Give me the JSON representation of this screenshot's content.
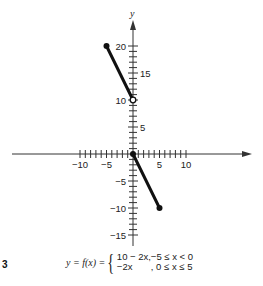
{
  "figure": {
    "number_label": "3",
    "y_axis_label": "y",
    "formula": {
      "lhs": "y = f(x) =",
      "cases": [
        {
          "expr": "10 − 2x,",
          "cond": "−5 ≤ x < 0"
        },
        {
          "expr": "−2x",
          "cond": ",   0 ≤ x ≤ 5"
        }
      ]
    }
  },
  "chart_data": {
    "type": "line",
    "title": "",
    "xlabel": "",
    "ylabel": "y",
    "function": "y = f(x) = { 10 − 2x, −5 ≤ x < 0 ; −2x, 0 ≤ x ≤ 5 }",
    "xlim": [
      -23,
      24
    ],
    "ylim": [
      -18,
      22
    ],
    "x_ticks": [
      -10,
      -9,
      -8,
      -7,
      -6,
      -5,
      -4,
      -3,
      -2,
      -1,
      0,
      1,
      2,
      3,
      4,
      5,
      6,
      7,
      8,
      9,
      10
    ],
    "x_tick_labels": [
      {
        "value": -10,
        "label": "−10"
      },
      {
        "value": -5,
        "label": "−5"
      },
      {
        "value": 5,
        "label": "5"
      },
      {
        "value": 10,
        "label": "10"
      }
    ],
    "y_ticks": [
      -15,
      -14,
      -13,
      -12,
      -11,
      -10,
      -9,
      -8,
      -7,
      -6,
      -5,
      -4,
      -3,
      -2,
      -1,
      0,
      1,
      2,
      3,
      4,
      5,
      6,
      7,
      8,
      9,
      10,
      11,
      12,
      13,
      14,
      15,
      16,
      17,
      18,
      19,
      20
    ],
    "y_tick_labels": [
      {
        "value": 20,
        "label": "20"
      },
      {
        "value": 15,
        "label": "15"
      },
      {
        "value": 10,
        "label": "10"
      },
      {
        "value": 5,
        "label": "5"
      },
      {
        "value": -5,
        "label": "−5"
      },
      {
        "value": -10,
        "label": "−10"
      },
      {
        "value": -15,
        "label": "−15"
      }
    ],
    "grid": false,
    "legend": null,
    "series": [
      {
        "name": "10 − 2x, −5 ≤ x < 0",
        "x": [
          -5,
          0
        ],
        "y": [
          20,
          10
        ],
        "endpoints": [
          {
            "x": -5,
            "y": 20,
            "style": "closed"
          },
          {
            "x": 0,
            "y": 10,
            "style": "open"
          }
        ]
      },
      {
        "name": "−2x, 0 ≤ x ≤ 5",
        "x": [
          0,
          5
        ],
        "y": [
          0,
          -10
        ],
        "endpoints": [
          {
            "x": 0,
            "y": 0,
            "style": "closed"
          },
          {
            "x": 5,
            "y": -10,
            "style": "closed"
          }
        ]
      }
    ],
    "colors": {
      "line": "#111111",
      "axis": "#333333",
      "background": "#ffffff"
    }
  }
}
